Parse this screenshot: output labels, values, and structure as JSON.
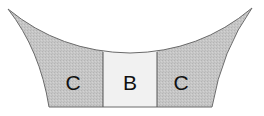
{
  "diagram": {
    "regions": [
      {
        "id": "left",
        "label": "C",
        "fill": "#c6c6c6"
      },
      {
        "id": "center",
        "label": "B",
        "fill": "#f1f1f1"
      },
      {
        "id": "right",
        "label": "C",
        "fill": "#c6c6c6"
      }
    ],
    "outline_color": "#6a6a6a",
    "divider_color": "#555555"
  }
}
